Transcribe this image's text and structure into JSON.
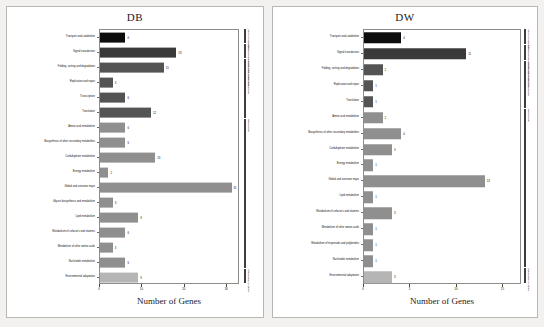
{
  "figure": {
    "background_color": "#f2f1ef",
    "panel_background": "#ffffff",
    "xlabel": "Number of Genes"
  },
  "palette": {
    "cellular_processes": "#0d0d0d",
    "environmental_information_processing": "#3a3a3a",
    "genetic_information_processing": "#545454",
    "metabolism": "#8f8f8f",
    "organismal_systems": "#b5b5b5",
    "axis": "#8e8c88",
    "text": "#111111"
  },
  "legend": {
    "groups": [
      "Cellular Processes",
      "Environmental Information Processing",
      "Genetic Information Processing",
      "Metabolism",
      "Organismal Systems"
    ]
  },
  "chart_data": [
    {
      "type": "bar",
      "orientation": "horizontal",
      "title": "DB",
      "xlabel": "Number of Genes",
      "ylabel": "",
      "xlim": [
        0,
        33
      ],
      "xticks": [
        0,
        10,
        20,
        30
      ],
      "grid": false,
      "legend_position": "right",
      "categories": [
        "Transport and catabolism",
        "Signal transduction",
        "Folding, sorting and degradation",
        "Replication and repair",
        "Transcription",
        "Translation",
        "Amino acid metabolism",
        "Biosynthesis of other secondary metabolites",
        "Carbohydrate metabolism",
        "Energy metabolism",
        "Global and overview maps",
        "Glycan biosynthesis and metabolism",
        "Lipid metabolism",
        "Metabolism of cofactors and vitamins",
        "Metabolism of other amino acids",
        "Nucleotide metabolism",
        "Environmental adaptation"
      ],
      "values": [
        6,
        18,
        15,
        3,
        6,
        12,
        6,
        6,
        13,
        2,
        31,
        3,
        9,
        6,
        3,
        6,
        9
      ],
      "groups": [
        "Cellular Processes",
        "Environmental Information Processing",
        "Genetic Information Processing",
        "Genetic Information Processing",
        "Genetic Information Processing",
        "Genetic Information Processing",
        "Metabolism",
        "Metabolism",
        "Metabolism",
        "Metabolism",
        "Metabolism",
        "Metabolism",
        "Metabolism",
        "Metabolism",
        "Metabolism",
        "Metabolism",
        "Organismal Systems"
      ]
    },
    {
      "type": "bar",
      "orientation": "horizontal",
      "title": "DW",
      "xlabel": "Number of Genes",
      "ylabel": "",
      "xlim": [
        0,
        17
      ],
      "xticks": [
        0,
        5,
        10,
        15
      ],
      "grid": false,
      "legend_position": "right",
      "categories": [
        "Transport and catabolism",
        "Signal transduction",
        "Folding, sorting and degradation",
        "Replication and repair",
        "Translation",
        "Amino acid metabolism",
        "Biosynthesis of other secondary metabolites",
        "Carbohydrate metabolism",
        "Energy metabolism",
        "Global and overview maps",
        "Lipid metabolism",
        "Metabolism of cofactors and vitamins",
        "Metabolism of other amino acids",
        "Metabolism of terpenoids and polyketides",
        "Nucleotide metabolism",
        "Environmental adaptation"
      ],
      "values": [
        4,
        11,
        2,
        1,
        1,
        2,
        4,
        3,
        1,
        13,
        1,
        3,
        1,
        1,
        1,
        3
      ],
      "groups": [
        "Cellular Processes",
        "Environmental Information Processing",
        "Genetic Information Processing",
        "Genetic Information Processing",
        "Genetic Information Processing",
        "Metabolism",
        "Metabolism",
        "Metabolism",
        "Metabolism",
        "Metabolism",
        "Metabolism",
        "Metabolism",
        "Metabolism",
        "Metabolism",
        "Metabolism",
        "Organismal Systems"
      ]
    }
  ]
}
